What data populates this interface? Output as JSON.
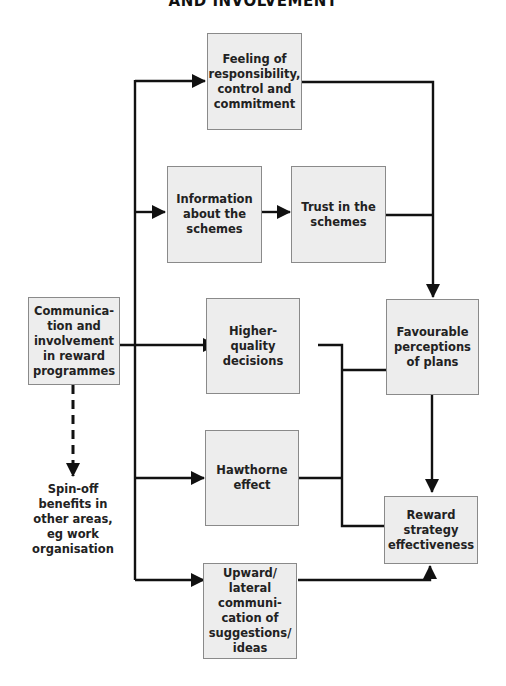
{
  "title": "AND INVOLVEMENT",
  "nodes": {
    "source": "Communica-\ntion and\ninvolvement\nin reward\nprogrammes",
    "responsibility": "Feeling of\nresponsibility,\ncontrol and\ncommitment",
    "information": "Information\nabout the\nschemes",
    "trust": "Trust in the\nschemes",
    "decisions": "Higher-\nquality\ndecisions",
    "hawthorne": "Hawthorne\neffect",
    "upward": "Upward/\nlateral\ncommuni-\ncation of\nsuggestions/\nideas",
    "perceptions": "Favourable\nperceptions\nof plans",
    "effectiveness": "Reward\nstrategy\neffectiveness",
    "spinoff": "Spin-off\nbenefits in\nother areas,\neg work\norganisation"
  },
  "edges": [
    {
      "from": "source",
      "to": "responsibility",
      "style": "solid"
    },
    {
      "from": "source",
      "to": "information",
      "style": "solid"
    },
    {
      "from": "information",
      "to": "trust",
      "style": "solid"
    },
    {
      "from": "source",
      "to": "decisions",
      "style": "solid"
    },
    {
      "from": "source",
      "to": "hawthorne",
      "style": "solid"
    },
    {
      "from": "source",
      "to": "upward",
      "style": "solid"
    },
    {
      "from": "responsibility",
      "to": "perceptions",
      "style": "solid"
    },
    {
      "from": "trust",
      "to": "perceptions",
      "style": "solid"
    },
    {
      "from": "decisions",
      "to": "perceptions",
      "style": "solid"
    },
    {
      "from": "hawthorne",
      "to": "effectiveness",
      "style": "solid"
    },
    {
      "from": "perceptions",
      "to": "effectiveness",
      "style": "solid"
    },
    {
      "from": "upward",
      "to": "effectiveness",
      "style": "solid"
    },
    {
      "from": "source",
      "to": "spinoff",
      "style": "dashed"
    }
  ],
  "colors": {
    "box_fill": "#ededed",
    "box_border": "#8a8a8a",
    "line": "#111111"
  }
}
